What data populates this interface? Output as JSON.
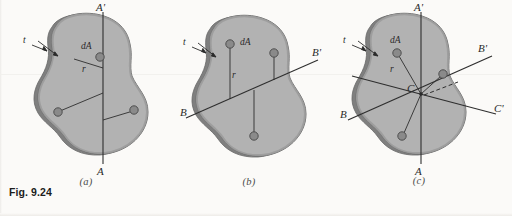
{
  "figure": {
    "caption": "Fig. 9.24",
    "panels": [
      {
        "id": "a",
        "label": "(a)",
        "axis_top_label": "A'",
        "axis_bottom_label": "A",
        "element_label": "dA",
        "distance_label": "r",
        "thickness_label": "t",
        "axis_kind": "vertical",
        "axes": [
          "A-A'"
        ],
        "element_count": 3
      },
      {
        "id": "b",
        "label": "(b)",
        "axis_left_label": "B",
        "axis_right_label": "B'",
        "element_label": "dA",
        "distance_label": "r",
        "thickness_label": "t",
        "axis_kind": "inclined",
        "axes": [
          "B-B'"
        ],
        "element_count": 3
      },
      {
        "id": "c",
        "label": "(c)",
        "axis_top_label": "A'",
        "axis_bottom_label": "A",
        "axis_left_label": "B",
        "axis_right_upper_label": "B'",
        "axis_right_lower_label": "C'",
        "center_label": "C",
        "element_label": "dA",
        "distance_label": "r",
        "thickness_label": "t",
        "axis_kind": "concurrent",
        "axes": [
          "A-A'",
          "B-B'",
          "C-C'"
        ],
        "element_count": 3
      }
    ]
  },
  "colors": {
    "page_background": "#fbfaf8",
    "plate_fill": "#b2b2b2",
    "plate_edge_dark": "#8d8d8d",
    "plate_outline": "#6f6f6f",
    "element_dot_fill": "#8a8a8a",
    "element_dot_stroke": "#4f4f4f",
    "axis_line": "#2e2e2e",
    "ink": "#2a2a2a",
    "caption_ink": "#1c1c1c"
  }
}
